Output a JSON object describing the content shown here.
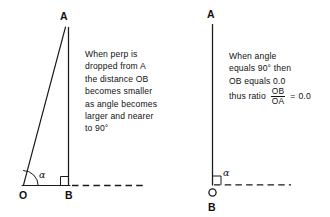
{
  "figure": {
    "background_color": "#ffffff",
    "stroke_color": "#1a1a1a",
    "left_diagram": {
      "name": "acute-angle-triangle",
      "points": {
        "apex_label": "A",
        "origin_label": "O",
        "foot_label": "B"
      },
      "angle_label": "α",
      "caption": {
        "lines": [
          "When perp is",
          "dropped from A",
          "the distance OB",
          "becomes smaller",
          "as angle becomes",
          "larger and nearer",
          "to 90°"
        ]
      }
    },
    "right_diagram": {
      "name": "right-angle-degenerate-triangle",
      "points": {
        "apex_label": "A",
        "origin_label": "O",
        "foot_label": "B"
      },
      "angle_label": "α",
      "caption": {
        "lines": [
          "When angle",
          "equals 90° then",
          "OB equals 0.0"
        ],
        "ratio": {
          "lead": "thus ratio",
          "numerator": "OB",
          "denominator": "OA",
          "equals": "=",
          "value": "0.0"
        }
      }
    }
  }
}
